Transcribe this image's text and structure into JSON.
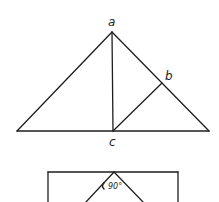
{
  "figure": {
    "upper": {
      "description": "Isosceles triangle with altitude from a to c and segment c to b",
      "labels": {
        "a": "a",
        "b": "b",
        "c": "c"
      }
    },
    "lower": {
      "description": "Rectangle with inner right-angle wedge",
      "angle_label": "90°"
    },
    "colors": {
      "stroke": "#1e1e1e",
      "background": "#ffffff"
    }
  }
}
